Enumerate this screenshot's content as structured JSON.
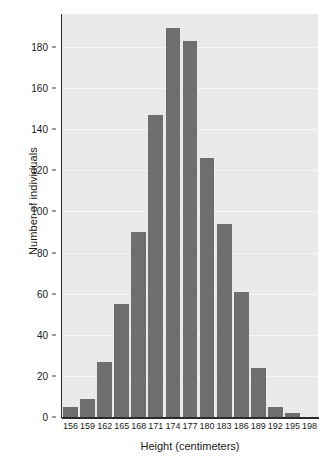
{
  "chart_data": {
    "type": "bar",
    "title": "",
    "subtitle": "",
    "xlabel": "Height (centimeters)",
    "ylabel": "Number of individuals",
    "categories": [
      "156",
      "159",
      "162",
      "165",
      "168",
      "171",
      "174",
      "177",
      "180",
      "183",
      "186",
      "189",
      "192",
      "195",
      "198"
    ],
    "values": [
      5,
      9,
      27,
      55,
      90,
      147,
      189,
      183,
      126,
      94,
      61,
      24,
      5,
      2,
      0
    ],
    "xtick_labels": [
      "156",
      "159",
      "162",
      "165",
      "168",
      "171",
      "174",
      "177",
      "180",
      "183",
      "186",
      "189",
      "192",
      "195",
      "198"
    ],
    "ytick_labels": [
      "0",
      "20",
      "40",
      "60",
      "80",
      "100",
      "120",
      "140",
      "160",
      "180"
    ],
    "ytick_values": [
      0,
      20,
      40,
      60,
      80,
      100,
      120,
      140,
      160,
      180
    ],
    "ylim": [
      0,
      196
    ],
    "xlim_labels": [
      "156",
      "198"
    ],
    "grid": true,
    "grid_axis": "y",
    "legend": null,
    "legend_position": "none",
    "annotations": [],
    "colors": {
      "bar": "#6e6e6e",
      "plot_background": "#e9e9e9",
      "gridline": "#f6f6f6",
      "axis": "#2b2b2b",
      "text": "#1a1a1a",
      "figure_background": "#ffffff"
    }
  }
}
